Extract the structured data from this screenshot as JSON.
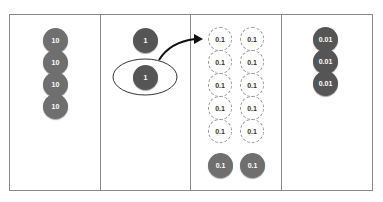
{
  "columns": [
    {
      "name": "tens",
      "chips": [
        {
          "label": "10"
        },
        {
          "label": "10"
        },
        {
          "label": "10"
        },
        {
          "label": "10"
        }
      ]
    },
    {
      "name": "ones",
      "chips": [
        {
          "label": "1"
        },
        {
          "label": "1",
          "circled": true
        }
      ]
    },
    {
      "name": "tenths",
      "dashed_chips": [
        {
          "label": "0.1"
        },
        {
          "label": "0.1"
        },
        {
          "label": "0.1"
        },
        {
          "label": "0.1"
        },
        {
          "label": "0.1"
        },
        {
          "label": "0.1"
        },
        {
          "label": "0.1"
        },
        {
          "label": "0.1"
        },
        {
          "label": "0.1"
        },
        {
          "label": "0.1"
        }
      ],
      "chips": [
        {
          "label": "0.1"
        },
        {
          "label": "0.1"
        }
      ]
    },
    {
      "name": "hundredths",
      "chips": [
        {
          "label": "0.01"
        },
        {
          "label": "0.01"
        },
        {
          "label": "0.01"
        }
      ]
    }
  ],
  "colors": {
    "chip": "#6f6f6f",
    "border": "#8a8a8a",
    "dashed": "#9a9a9a"
  }
}
